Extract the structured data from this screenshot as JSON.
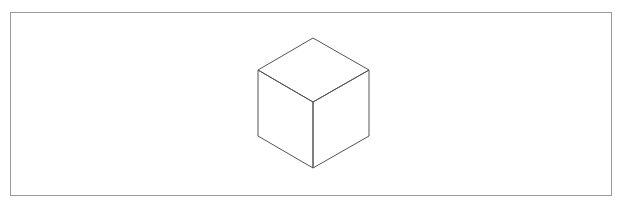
{
  "diagram": {
    "shape": "isometric-cube",
    "stroke_color": "#555555",
    "frame_color": "#9a9a9a",
    "background": "#ffffff",
    "vertices": {
      "top": [
        313,
        38
      ],
      "upper_left": [
        258,
        70
      ],
      "upper_right": [
        369,
        70
      ],
      "center": [
        313,
        102
      ],
      "lower_left": [
        258,
        136
      ],
      "lower_right": [
        369,
        136
      ],
      "bottom": [
        313,
        168
      ]
    }
  }
}
